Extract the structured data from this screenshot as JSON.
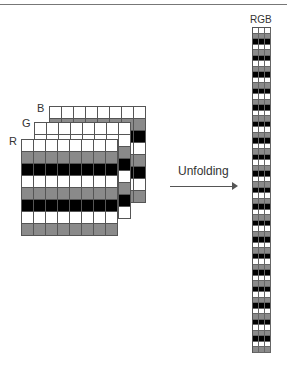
{
  "labels": {
    "r": "R",
    "g": "G",
    "b": "B",
    "column": "RGB",
    "arrow": "Unfolding"
  },
  "colors": {
    "white": "#ffffff",
    "gray": "#8a8a8a",
    "black": "#000000",
    "line": "#555555"
  },
  "layers": {
    "rows": 8,
    "cols": 8,
    "r_pattern": [
      "w",
      "g",
      "k",
      "w",
      "g",
      "k",
      "w",
      "g"
    ],
    "g_pattern": [
      "w",
      "w",
      "g",
      "k",
      "w",
      "g",
      "k",
      "w"
    ],
    "b_pattern": [
      "w",
      "g",
      "k",
      "w",
      "g",
      "k",
      "w",
      "g"
    ]
  },
  "column": {
    "cols": 3,
    "row_pattern": [
      "w",
      "g",
      "k"
    ],
    "rows": 59
  }
}
